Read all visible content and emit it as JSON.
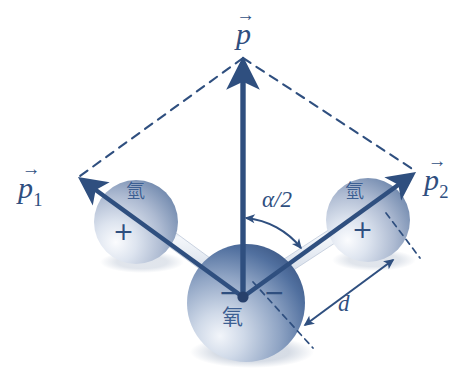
{
  "figure": {
    "background_color": "#ffffff",
    "ink_color": "#2f4f7f",
    "sphere_dark": "#3c5f94",
    "sphere_light": "#e9eef6",
    "bond_color": "#c9d4e2"
  },
  "labels": {
    "resultant_vector": {
      "symbol": "p",
      "subscript": "",
      "arrow": "→"
    },
    "vector_1": {
      "symbol": "p",
      "subscript": "1",
      "arrow": "→"
    },
    "vector_2": {
      "symbol": "p",
      "subscript": "2",
      "arrow": "→"
    },
    "half_angle": "α/2",
    "bond_length": "d"
  },
  "atoms": [
    {
      "id": "hydrogen-left",
      "element_label": "氫",
      "charge_sign": "+",
      "charge": "positive"
    },
    {
      "id": "hydrogen-right",
      "element_label": "氫",
      "charge_sign": "+",
      "charge": "positive"
    },
    {
      "id": "oxygen-center",
      "element_label": "氧",
      "charge_sign_left": "−",
      "charge_sign_right": "−",
      "charge": "negative"
    }
  ],
  "geometry": {
    "origin": {
      "x": 243,
      "y": 297
    },
    "hydrogen_left_center": {
      "x": 136,
      "y": 222
    },
    "hydrogen_right_center": {
      "x": 368,
      "y": 220
    },
    "oxygen_center": {
      "x": 246,
      "y": 303
    },
    "oxygen_radius": 59,
    "hydrogen_radius": 42,
    "resultant_tip": {
      "x": 243,
      "y": 59
    },
    "p1_tip": {
      "x": 78,
      "y": 178
    },
    "p2_tip": {
      "x": 416,
      "y": 172
    },
    "parallelogram_dashed": true,
    "angle_arc_label_position": {
      "x": 272,
      "y": 199
    }
  }
}
